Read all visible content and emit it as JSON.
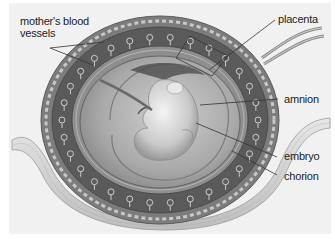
{
  "diagram": {
    "labels": [
      {
        "id": "mothers-blood-vessels",
        "line1": "mother's blood",
        "line2": "vessels"
      },
      {
        "id": "placenta",
        "text": "placenta"
      },
      {
        "id": "amnion",
        "text": "amnion"
      },
      {
        "id": "embryo",
        "text": "embryo"
      },
      {
        "id": "chorion",
        "text": "chorion"
      }
    ],
    "colors": {
      "background": "#f1f1f1",
      "outer_ring": "#8a8a8a",
      "villi_band": "#5c5c5c",
      "amniotic_cavity": "#a8a8a8",
      "embryo": "#d8d8d8",
      "uterine_wall": "#d9d9d9",
      "label_text": "#222222",
      "leader_line": "#333333"
    }
  }
}
